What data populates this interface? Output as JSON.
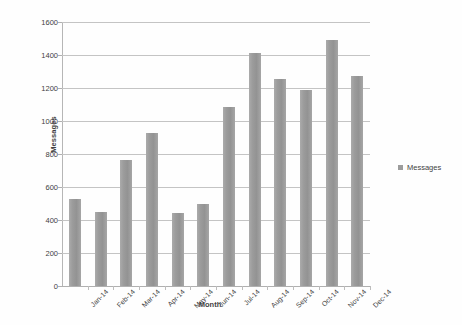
{
  "chart_data": {
    "type": "bar",
    "title": "",
    "xlabel": "Month",
    "ylabel": "Messages",
    "categories": [
      "Jan-14",
      "Feb-14",
      "Mar-14",
      "Apr-14",
      "May-14",
      "Jun-14",
      "Jul-14",
      "Aug-14",
      "Sep-14",
      "Oct-14",
      "Nov-14",
      "Dec-14"
    ],
    "values": [
      525,
      450,
      765,
      930,
      440,
      500,
      1085,
      1415,
      1255,
      1190,
      1490,
      1275
    ],
    "series": [
      {
        "name": "Messages",
        "values": [
          525,
          450,
          765,
          930,
          440,
          500,
          1085,
          1415,
          1255,
          1190,
          1490,
          1275
        ]
      }
    ],
    "ylim": [
      0,
      1600
    ],
    "yticks": [
      0,
      200,
      400,
      600,
      800,
      1000,
      1200,
      1400,
      1600
    ],
    "ytick_labels": [
      "0",
      "200",
      "400",
      "600",
      "800",
      "1000",
      "1200",
      "1400",
      "1600"
    ],
    "grid": true,
    "legend": {
      "position": "right",
      "entries": [
        {
          "label": "Messages",
          "color": "#9c9c9c"
        }
      ]
    },
    "bar_color": "#9c9c9c",
    "gridline_color": "#c4c4c4",
    "axis_color": "#b0b0b0",
    "text_color": "#3f3f3f",
    "background_color": "#ffffff"
  }
}
